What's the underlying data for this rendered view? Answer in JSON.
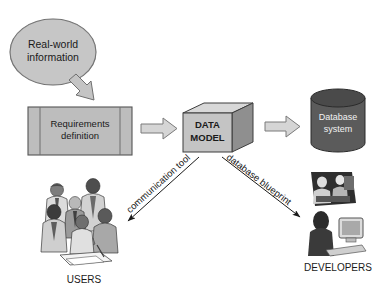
{
  "diagram": {
    "title_text_present": false,
    "nodes": {
      "real_world": {
        "label_line1": "Real-world",
        "label_line2": "information",
        "shape": "ellipse",
        "fill": "#c6c6c6",
        "stroke": "#555555"
      },
      "requirements": {
        "label_line1": "Requirements",
        "label_line2": "definition",
        "shape": "document-box",
        "fill": "#bdbdbd",
        "stroke": "#555555"
      },
      "data_model": {
        "label_line1": "DATA",
        "label_line2": "MODEL",
        "shape": "3d-box",
        "fill": "#c4c4c4",
        "top_fill": "#d8d8d8",
        "side_fill": "#8f8f8f",
        "stroke": "#3d3d3d"
      },
      "database": {
        "label_line1": "Database",
        "label_line2": "system",
        "shape": "cylinder",
        "fill": "#5b5b5b",
        "top_fill": "#4a4a4a",
        "stroke": "#2b2b2b",
        "text_color": "#f2f2f2"
      },
      "users": {
        "label": "USERS",
        "shape": "photo-group-of-people"
      },
      "developers": {
        "label": "DEVELOPERS",
        "shape": "photo-developers-at-computers"
      }
    },
    "arrows": {
      "realworld_to_requirements": {
        "label": "",
        "style": "block-arrow-diagonal",
        "fill": "#c4c4c4",
        "stroke": "#6b6b6b"
      },
      "requirements_to_datamodel": {
        "label": "",
        "style": "block-arrow-right",
        "fill": "#d5d5d5",
        "stroke": "#7a7a7a"
      },
      "datamodel_to_database": {
        "label": "",
        "style": "block-arrow-right",
        "fill": "#d5d5d5",
        "stroke": "#7a7a7a"
      },
      "datamodel_to_users": {
        "label": "communication tool",
        "style": "thin-line-arrow",
        "stroke": "#1a1a1a"
      },
      "datamodel_to_developers": {
        "label": "database blueprint",
        "style": "thin-line-arrow",
        "stroke": "#1a1a1a"
      }
    }
  }
}
